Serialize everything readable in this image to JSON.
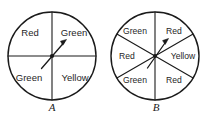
{
  "figure": {
    "background_color": "#ffffff",
    "ink_color": "#1a1a1a",
    "spinners": [
      {
        "caption": "A",
        "sector_count": 4,
        "sectors": [
          {
            "label": "Red",
            "position": "top-left",
            "start_deg": 90,
            "end_deg": 180
          },
          {
            "label": "Green",
            "position": "top-right",
            "start_deg": 0,
            "end_deg": 90
          },
          {
            "label": "Green",
            "position": "bottom-left",
            "start_deg": 180,
            "end_deg": 270
          },
          {
            "label": "Yellow",
            "position": "bottom-right",
            "start_deg": 270,
            "end_deg": 360
          }
        ],
        "needle": {
          "direction": "up-right",
          "angle_deg": 40
        }
      },
      {
        "caption": "B",
        "sector_count": 6,
        "sectors": [
          {
            "label": "Green",
            "position": "top-left",
            "start_deg": 90,
            "end_deg": 150
          },
          {
            "label": "Red",
            "position": "top-right",
            "start_deg": 30,
            "end_deg": 90
          },
          {
            "label": "Red",
            "position": "left",
            "start_deg": 150,
            "end_deg": 210
          },
          {
            "label": "Yellow",
            "position": "right",
            "start_deg": 330,
            "end_deg": 30
          },
          {
            "label": "Green",
            "position": "bottom-left",
            "start_deg": 210,
            "end_deg": 270
          },
          {
            "label": "Red",
            "position": "bottom-right",
            "start_deg": 270,
            "end_deg": 330
          }
        ],
        "needle": {
          "direction": "up-right",
          "angle_deg": 45
        }
      }
    ]
  }
}
